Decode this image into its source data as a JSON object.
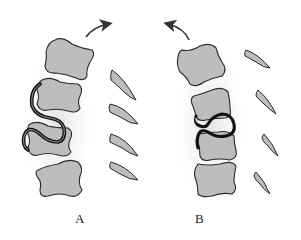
{
  "figure": {
    "panels": [
      {
        "id": "A",
        "label": "A",
        "arrow_direction": "clockwise-right",
        "vertebrae_count": 4,
        "spinous_processes_count": 4,
        "cord_shape": "S-curve wrapping around vertebrae 2 and 3"
      },
      {
        "id": "B",
        "label": "B",
        "arrow_direction": "counterclockwise-left",
        "vertebrae_count": 4,
        "spinous_processes_count": 4,
        "cord_shape": "looped curve between vertebrae 2 and 3"
      }
    ]
  },
  "colors": {
    "background": "#ffffff",
    "bone_fill": "#bdbdbd",
    "bone_outline": "#2a2a2a",
    "cord_outline": "#111111",
    "shadow": "#e6e6e6",
    "arrow": "#333333",
    "label": "#222222"
  }
}
